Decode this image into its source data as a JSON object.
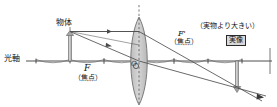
{
  "figure": {
    "type": "convex-lens-ray-diagram",
    "title_text": "",
    "labels": {
      "optical_axis": "光軸",
      "object": "物体",
      "focus_left": "F",
      "focus_left_sub": "（焦点）",
      "focus_right": "F'",
      "focus_right_sub": "（焦点）",
      "lens_center": "O",
      "image_note": "（実物より大きい）",
      "image_badge": "実像"
    },
    "colors": {
      "line": "#3a3a3a",
      "ray": "#555555",
      "lens_fill": "#c9c9c9",
      "lens_stroke": "#6f6f6f",
      "badge_fill": "#d9d9d9",
      "badge_stroke": "#2a2a2a",
      "arrow_fill": "#b5b5b5",
      "background": "#ffffff"
    },
    "geometry": {
      "axis_y": 61,
      "axis_x_start": 10,
      "axis_x_end": 272,
      "lens_x": 139,
      "lens_top_y": 18,
      "lens_bottom_y": 104,
      "lens_half_width": 11,
      "object_x": 70,
      "object_top_y": 33,
      "focus_left_x": 104,
      "focus_right_x": 174,
      "second_focus_left_x": 70,
      "second_focus_right_x": 208,
      "image_x": 237,
      "image_bottom_y": 92,
      "ticks_x": [
        70,
        104,
        174,
        208
      ]
    }
  }
}
